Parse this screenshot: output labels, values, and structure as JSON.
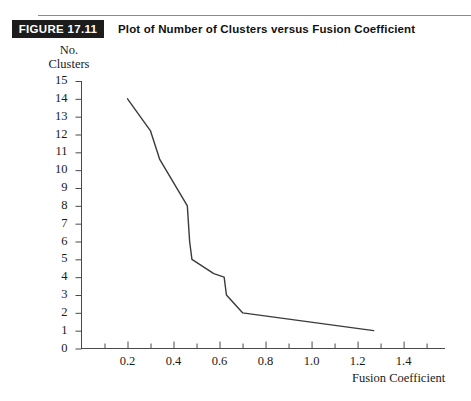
{
  "header": {
    "figure_badge": "FIGURE 17.11",
    "title": "Plot of Number of Clusters versus Fusion Coefficient"
  },
  "chart_data": {
    "type": "line",
    "title": "Plot of Number of Clusters versus Fusion Coefficient",
    "subtitle": "",
    "xlabel": "Fusion Coefficient",
    "ylabel_line1": "No.",
    "ylabel_line2": "Clusters",
    "xlim": [
      0,
      1.5
    ],
    "ylim": [
      0,
      15
    ],
    "xticks": [
      0.2,
      0.4,
      0.6,
      0.8,
      1.0,
      1.2,
      1.4
    ],
    "xtick_labels": [
      "0.2",
      "0.4",
      "0.6",
      "0.8",
      "1.0",
      "1.2",
      "1.4"
    ],
    "xminor_step": 0.1,
    "yticks": [
      0,
      1,
      2,
      3,
      4,
      5,
      6,
      7,
      8,
      9,
      10,
      11,
      12,
      13,
      14,
      15
    ],
    "ytick_labels": [
      "0",
      "1",
      "2",
      "3",
      "4",
      "5",
      "6",
      "7",
      "8",
      "9",
      "10",
      "11",
      "12",
      "13",
      "14",
      "15"
    ],
    "grid": false,
    "legend": null,
    "line_color": "#3a3a3a",
    "line_width": 1.4,
    "series": [
      {
        "name": "Number of clusters",
        "x": [
          0.2,
          0.3,
          0.33,
          0.34,
          0.46,
          0.47,
          0.48,
          0.575,
          0.62,
          0.63,
          0.7,
          1.27
        ],
        "y": [
          14.0,
          12.2,
          11.0,
          10.6,
          8.0,
          6.0,
          5.0,
          4.2,
          4.0,
          3.0,
          2.0,
          1.0
        ]
      }
    ]
  },
  "axis": {
    "x_tick_positions_px": [
      107.2,
      158.4,
      209.6,
      260.8,
      312.0,
      363.2,
      414.4
    ],
    "y_origin_px": 348,
    "x_origin_px": 56
  }
}
